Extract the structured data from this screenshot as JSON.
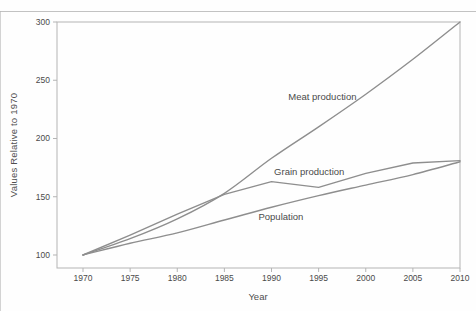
{
  "chart_data": {
    "type": "line",
    "title": "",
    "xlabel": "Year",
    "ylabel": "Values Relative to 1970",
    "x": [
      1970,
      1975,
      1980,
      1985,
      1990,
      1995,
      2000,
      2005,
      2010
    ],
    "series": [
      {
        "name": "Meat production",
        "values": [
          100,
          114,
          131,
          153,
          183,
          210,
          238,
          268,
          300
        ],
        "smooth": true,
        "label": {
          "text": "Meat production",
          "year": 1995.4,
          "value": 236
        }
      },
      {
        "name": "Grain production",
        "values": [
          100,
          117,
          135,
          152,
          163,
          158,
          170,
          179,
          181
        ],
        "smooth": false,
        "label": {
          "text": "Grain production",
          "year": 1994.0,
          "value": 172
        }
      },
      {
        "name": "Population",
        "values": [
          100,
          110,
          119,
          130,
          141,
          151,
          160,
          169,
          180
        ],
        "smooth": true,
        "label": {
          "text": "Population",
          "year": 1991.0,
          "value": 133
        }
      }
    ],
    "xticks": [
      1970,
      1975,
      1980,
      1985,
      1990,
      1995,
      2000,
      2005,
      2010
    ],
    "yticks": [
      100,
      150,
      200,
      250,
      300
    ],
    "xlim": [
      1967.24,
      2010
    ],
    "ylim": [
      88.84,
      300
    ],
    "grid": false,
    "legend": "inline-labels",
    "line_color": "#8e8e8e",
    "frame_color": "#b4b4b4",
    "text_color": "#4a4a4a"
  }
}
